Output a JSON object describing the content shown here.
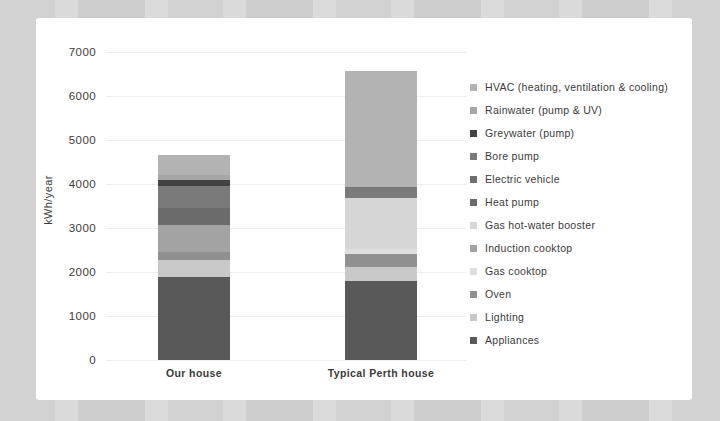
{
  "chart_data": {
    "type": "bar",
    "stacked": true,
    "title": "",
    "xlabel": "",
    "ylabel": "kWh/year",
    "ylim": [
      0,
      7000
    ],
    "yticks": [
      0,
      1000,
      2000,
      3000,
      4000,
      5000,
      6000,
      7000
    ],
    "grid": true,
    "legend_position": "right",
    "categories": [
      "Our house",
      "Typical Perth house"
    ],
    "series": [
      {
        "name": "HVAC (heating, ventilation & cooling)",
        "color": "#b3b3b3",
        "values": [
          455,
          2650
        ]
      },
      {
        "name": "Rainwater (pump & UV)",
        "color": "#a6a6a6",
        "values": [
          110,
          0
        ]
      },
      {
        "name": "Greywater (pump)",
        "color": "#424242",
        "values": [
          120,
          0
        ]
      },
      {
        "name": "Bore pump",
        "color": "#7a7a7a",
        "values": [
          500,
          250
        ]
      },
      {
        "name": "Electric vehicle",
        "color": "#6f6f6f",
        "values": [
          0,
          0
        ]
      },
      {
        "name": "Heat pump",
        "color": "#6b6b6b",
        "values": [
          400,
          0
        ]
      },
      {
        "name": "Gas hot-water booster",
        "color": "#d6d6d6",
        "values": [
          0,
          1150
        ]
      },
      {
        "name": "Induction cooktop",
        "color": "#a3a3a3",
        "values": [
          615,
          0
        ]
      },
      {
        "name": "Gas cooktop",
        "color": "#dedede",
        "values": [
          0,
          120
        ]
      },
      {
        "name": "Oven",
        "color": "#909090",
        "values": [
          185,
          300
        ]
      },
      {
        "name": "Lighting",
        "color": "#c8c8c8",
        "values": [
          385,
          310
        ]
      },
      {
        "name": "Appliances",
        "color": "#595959",
        "values": [
          1880,
          1800
        ]
      }
    ],
    "totals": [
      4650,
      6580
    ]
  },
  "layout": {
    "y0_px": 342,
    "px_per_unit": 0.044,
    "bar_lefts": [
      122,
      309
    ],
    "bar_width": 72
  }
}
